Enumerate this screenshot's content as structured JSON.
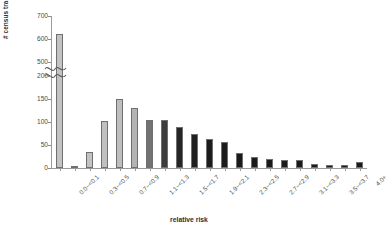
{
  "chart_data": {
    "type": "bar",
    "title": "",
    "xlabel": "relative risk",
    "ylabel": "# census tracts",
    "grid": false,
    "legend": null,
    "axis_break": {
      "present": true,
      "lower_max": 200,
      "upper_min": 500
    },
    "ylim": [
      0,
      700
    ],
    "yticks": [
      0,
      50,
      100,
      150,
      200,
      500,
      600,
      700
    ],
    "categories": [
      "0.0~<0.1",
      "0.1~<0.3",
      "0.3~<0.5",
      "0.5~<0.7",
      "0.7~<0.9",
      "0.9~<1.1",
      "1.1~<1.3",
      "1.3~<1.5",
      "1.5~<1.7",
      "1.7~<1.9",
      "1.9~<2.1",
      "2.1~<2.3",
      "2.3~<2.5",
      "2.5~<2.7",
      "2.7~<2.9",
      "2.9~<3.1",
      "3.1~<3.3",
      "3.3~<3.5",
      "3.5~<3.7",
      "3.7~<4.0",
      "4.0+"
    ],
    "tick_labels_shown": [
      "0.0~<0.1",
      "",
      "0.3~<0.5",
      "",
      "0.7~<0.9",
      "",
      "1.1~<1.3",
      "",
      "1.5~<1.7",
      "",
      "1.9~<2.1",
      "",
      "2.3~<2.5",
      "",
      "2.7~<2.9",
      "",
      "3.1~<3.3",
      "",
      "3.5~<3.7",
      "",
      "4.0+"
    ],
    "values": [
      622,
      2,
      35,
      103,
      151,
      131,
      104,
      104,
      90,
      74,
      64,
      56,
      32,
      25,
      20,
      18,
      18,
      8,
      7,
      6,
      13
    ],
    "bar_colors": [
      "#c3c3c3",
      "#c3c3c3",
      "#c3c3c3",
      "#c0c0c0",
      "#bebebe",
      "#b4b4b4",
      "#727272",
      "#3c3c3c",
      "#262626",
      "#1f1f1f",
      "#1c1c1c",
      "#1b1b1b",
      "#1a1a1a",
      "#1a1a1a",
      "#1a1a1a",
      "#1a1a1a",
      "#1a1a1a",
      "#1a1a1a",
      "#1a1a1a",
      "#1a1a1a",
      "#1a1a1a"
    ]
  }
}
